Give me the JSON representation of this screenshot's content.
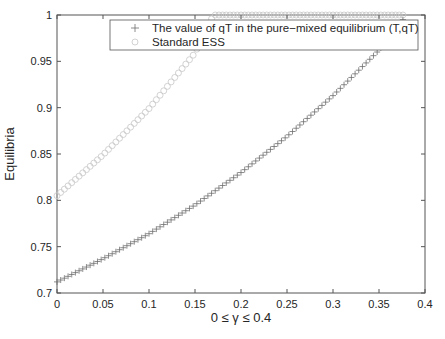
{
  "chart_data": {
    "type": "scatter",
    "title": "",
    "xlabel": "0 ≤ γ ≤ 0.4",
    "ylabel": "Equilibria",
    "xlim": [
      0,
      0.4
    ],
    "ylim": [
      0.7,
      1.0
    ],
    "xticks": [
      "0",
      "0.05",
      "0.1",
      "0.15",
      "0.2",
      "0.25",
      "0.3",
      "0.35",
      "0.4"
    ],
    "yticks": [
      "0.7",
      "0.75",
      "0.8",
      "0.85",
      "0.9",
      "0.95",
      "1"
    ],
    "grid": false,
    "legend_position": "top-right inside",
    "series": [
      {
        "name": "The value of qT in the pure−mixed equilibrium (T,qT)",
        "marker": "plus",
        "color": "#6e6e6e",
        "x": [
          0,
          0.05,
          0.1,
          0.15,
          0.2,
          0.25,
          0.3,
          0.35,
          0.38
        ],
        "values": [
          0.712,
          0.737,
          0.764,
          0.795,
          0.83,
          0.869,
          0.913,
          0.962,
          1.0
        ]
      },
      {
        "name": "Standard ESS",
        "marker": "circle",
        "color": "#c8c8c8",
        "x": [
          0,
          0.05,
          0.1,
          0.15,
          0.17,
          0.2,
          0.25,
          0.3,
          0.35,
          0.38
        ],
        "values": [
          0.805,
          0.849,
          0.899,
          0.959,
          1.0,
          1.0,
          1.0,
          1.0,
          1.0,
          1.0
        ]
      }
    ]
  },
  "legend": {
    "items": [
      {
        "symbol": "+",
        "label": "The value of qT in the pure−mixed equilibrium (T,qT)"
      },
      {
        "symbol": "○",
        "label": "Standard ESS"
      }
    ]
  },
  "axes": {
    "xlabel": "0 ≤ γ ≤ 0.4",
    "ylabel": "Equilibria"
  }
}
